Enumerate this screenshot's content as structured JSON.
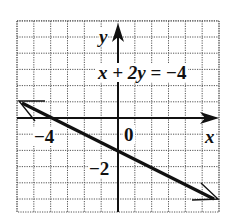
{
  "chart_data": {
    "type": "line",
    "title": "",
    "equation": "x + 2y = −4",
    "xlabel": "x",
    "ylabel": "y",
    "xlim": [
      -6,
      6
    ],
    "ylim": [
      -5.7,
      6
    ],
    "grid": true,
    "grid_step": 1,
    "tick_labels": {
      "x": [
        {
          "value": -4,
          "label": "−4"
        },
        {
          "value": 0,
          "label": "0"
        }
      ],
      "y": [
        {
          "value": -2,
          "label": "−2"
        }
      ]
    },
    "series": [
      {
        "name": "x + 2y = −4",
        "x": [
          -6,
          -4,
          0,
          6
        ],
        "y": [
          1,
          0,
          -2,
          -5
        ],
        "arrows": "both",
        "color": "#111111"
      }
    ]
  },
  "labels": {
    "y_axis": "y",
    "x_axis": "x",
    "equation_lhs": "x + 2",
    "equation_y": "y",
    "equation_rhs": " = −4",
    "tick_x_neg4": "−4",
    "tick_origin": "0",
    "tick_y_neg2": "−2"
  },
  "colors": {
    "line": "#111111",
    "grid": "#555555",
    "background": "#ffffff"
  }
}
